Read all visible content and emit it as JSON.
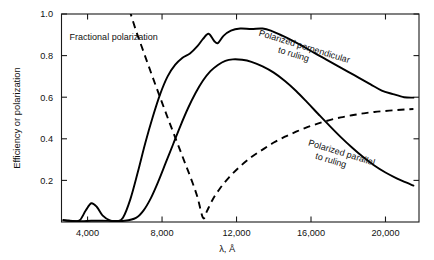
{
  "chart_data": {
    "type": "line",
    "title": "",
    "xlabel": "λ, Å",
    "ylabel": "Efficiency or polarization",
    "xlim": [
      2600,
      21800
    ],
    "ylim": [
      0.0,
      1.0
    ],
    "grid": false,
    "legend_position": "inline-annotations",
    "xticks": [
      4000,
      8000,
      12000,
      16000,
      20000
    ],
    "xtick_labels": [
      "4,000",
      "8,000",
      "12,000",
      "16,000",
      "20,000"
    ],
    "yticks": [
      0.2,
      0.4,
      0.6,
      0.8,
      1.0
    ],
    "ytick_labels": [
      "0.2",
      "0.4",
      "0.6",
      "0.8",
      "1.0"
    ],
    "annotations": [
      {
        "text": "Fractional polarization",
        "x": 5400,
        "y": 0.875,
        "rotation": 0
      },
      {
        "text_line1": "Polarized perpendicular",
        "text_line2": "to ruling",
        "x": 15600,
        "y": 0.83,
        "rotation": 17
      },
      {
        "text_line1": "Polarized parallel",
        "text_line2": "to ruling",
        "x": 17600,
        "y": 0.32,
        "rotation": 17
      }
    ],
    "series": [
      {
        "name": "Polarized perpendicular to ruling",
        "style": "solid",
        "points": [
          [
            2700,
            0.01
          ],
          [
            3000,
            0.006
          ],
          [
            3300,
            0.004
          ],
          [
            3600,
            0.01
          ],
          [
            3900,
            0.055
          ],
          [
            4200,
            0.09
          ],
          [
            4500,
            0.072
          ],
          [
            4800,
            0.032
          ],
          [
            5200,
            0.008
          ],
          [
            5600,
            0.004
          ],
          [
            5900,
            0.02
          ],
          [
            6300,
            0.11
          ],
          [
            6700,
            0.24
          ],
          [
            7100,
            0.38
          ],
          [
            7500,
            0.505
          ],
          [
            7900,
            0.615
          ],
          [
            8300,
            0.7
          ],
          [
            8700,
            0.755
          ],
          [
            9100,
            0.79
          ],
          [
            9500,
            0.81
          ],
          [
            9900,
            0.845
          ],
          [
            10200,
            0.88
          ],
          [
            10500,
            0.905
          ],
          [
            10800,
            0.87
          ],
          [
            11000,
            0.86
          ],
          [
            11300,
            0.895
          ],
          [
            11700,
            0.92
          ],
          [
            12200,
            0.93
          ],
          [
            12800,
            0.928
          ],
          [
            13400,
            0.93
          ],
          [
            13900,
            0.918
          ],
          [
            14400,
            0.898
          ],
          [
            15000,
            0.872
          ],
          [
            15600,
            0.843
          ],
          [
            16200,
            0.812
          ],
          [
            16800,
            0.782
          ],
          [
            17400,
            0.752
          ],
          [
            18000,
            0.722
          ],
          [
            18600,
            0.692
          ],
          [
            19200,
            0.662
          ],
          [
            19800,
            0.632
          ],
          [
            20400,
            0.615
          ],
          [
            21000,
            0.6
          ],
          [
            21500,
            0.598
          ]
        ]
      },
      {
        "name": "Polarized parallel to ruling",
        "style": "solid",
        "points": [
          [
            2700,
            0.008
          ],
          [
            3200,
            0.005
          ],
          [
            3700,
            0.004
          ],
          [
            4200,
            0.006
          ],
          [
            4800,
            0.006
          ],
          [
            5400,
            0.005
          ],
          [
            6000,
            0.006
          ],
          [
            6600,
            0.02
          ],
          [
            7000,
            0.055
          ],
          [
            7400,
            0.115
          ],
          [
            7800,
            0.195
          ],
          [
            8200,
            0.285
          ],
          [
            8600,
            0.375
          ],
          [
            9000,
            0.465
          ],
          [
            9400,
            0.548
          ],
          [
            9800,
            0.62
          ],
          [
            10200,
            0.68
          ],
          [
            10600,
            0.725
          ],
          [
            11000,
            0.755
          ],
          [
            11400,
            0.775
          ],
          [
            11800,
            0.782
          ],
          [
            12300,
            0.78
          ],
          [
            12800,
            0.77
          ],
          [
            13400,
            0.748
          ],
          [
            14000,
            0.718
          ],
          [
            14600,
            0.678
          ],
          [
            15200,
            0.63
          ],
          [
            15800,
            0.575
          ],
          [
            16400,
            0.518
          ],
          [
            17000,
            0.462
          ],
          [
            17600,
            0.408
          ],
          [
            18200,
            0.358
          ],
          [
            18800,
            0.312
          ],
          [
            19400,
            0.272
          ],
          [
            20000,
            0.238
          ],
          [
            20600,
            0.21
          ],
          [
            21100,
            0.19
          ],
          [
            21500,
            0.175
          ]
        ]
      },
      {
        "name": "Fractional polarization",
        "style": "dashed",
        "points": [
          [
            6250,
            1.02
          ],
          [
            6600,
            0.92
          ],
          [
            6900,
            0.845
          ],
          [
            7200,
            0.77
          ],
          [
            7500,
            0.695
          ],
          [
            7800,
            0.622
          ],
          [
            8100,
            0.55
          ],
          [
            8400,
            0.478
          ],
          [
            8700,
            0.408
          ],
          [
            9000,
            0.338
          ],
          [
            9300,
            0.268
          ],
          [
            9600,
            0.198
          ],
          [
            9900,
            0.12
          ],
          [
            10200,
            0.02
          ],
          [
            10400,
            0.05
          ],
          [
            10700,
            0.105
          ],
          [
            11100,
            0.16
          ],
          [
            11600,
            0.215
          ],
          [
            12200,
            0.268
          ],
          [
            12800,
            0.312
          ],
          [
            13400,
            0.348
          ],
          [
            14000,
            0.382
          ],
          [
            14600,
            0.41
          ],
          [
            15200,
            0.434
          ],
          [
            15800,
            0.456
          ],
          [
            16400,
            0.474
          ],
          [
            17000,
            0.49
          ],
          [
            17600,
            0.503
          ],
          [
            18200,
            0.513
          ],
          [
            18800,
            0.522
          ],
          [
            19400,
            0.529
          ],
          [
            20000,
            0.534
          ],
          [
            20600,
            0.538
          ],
          [
            21100,
            0.541
          ],
          [
            21500,
            0.543
          ]
        ]
      }
    ]
  }
}
